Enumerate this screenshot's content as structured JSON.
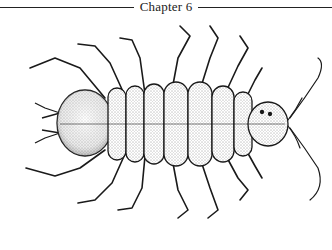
{
  "header": {
    "chapter_label": "Chapter 6"
  },
  "figure": {
    "style": "stippled pen-and-ink dorsal view",
    "ink_color": "#1a1a1a",
    "background": "#ffffff"
  }
}
